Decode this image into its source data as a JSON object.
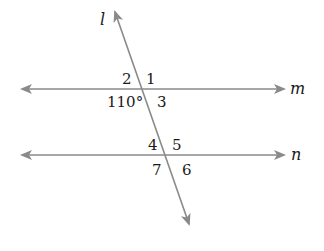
{
  "figure": {
    "type": "parallel lines cut by a transversal",
    "line_color": "#8a8a8a",
    "text_color": "#1a1a1a",
    "lines": {
      "transversal": {
        "label": "l",
        "from": [
          113,
          12
        ],
        "to": [
          190,
          225
        ]
      },
      "m": {
        "label": "m",
        "y": 89,
        "x_from": 20,
        "x_to": 285
      },
      "n": {
        "label": "n",
        "y": 155,
        "x_from": 20,
        "x_to": 285
      }
    },
    "angles": {
      "a1": "1",
      "a2": "2",
      "a3": "3",
      "a110": "110°",
      "a4": "4",
      "a5": "5",
      "a6": "6",
      "a7": "7"
    }
  }
}
